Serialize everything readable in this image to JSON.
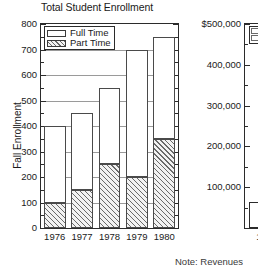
{
  "chart_data": [
    {
      "type": "bar",
      "id": "total-student-enrollment",
      "title": "Total Student Enrollment",
      "subtitle": "",
      "xlabel": "",
      "ylabel": "Fall Enrollment",
      "stacked": true,
      "grid": true,
      "legend_position": "top-left",
      "categories": [
        "1976",
        "1977",
        "1978",
        "1979",
        "1980"
      ],
      "ylim": [
        0,
        800
      ],
      "ytick_labels": [
        "0",
        "100",
        "200",
        "300",
        "400",
        "500",
        "600",
        "700",
        "800"
      ],
      "ytick_values": [
        0,
        100,
        200,
        300,
        400,
        500,
        600,
        700,
        800
      ],
      "minor_tick_interval": 50,
      "series": [
        {
          "name": "Part Time",
          "fill": "diagonal-hatch",
          "values": [
            100,
            150,
            250,
            200,
            350
          ]
        },
        {
          "name": "Full Time",
          "fill": "white",
          "values": [
            300,
            300,
            300,
            500,
            400
          ]
        }
      ],
      "totals": [
        400,
        450,
        550,
        700,
        750
      ],
      "colors": {
        "axis": "#2b2b2b",
        "gridline": "#9a9a9a",
        "bar_outline": "#4a4a4a",
        "hatch": "#6a6a6a",
        "background": "#ffffff"
      }
    },
    {
      "type": "bar",
      "id": "revenues-partial",
      "title": "",
      "ylabel": "",
      "clipped": true,
      "ytick_labels": [
        "$500,000",
        "400,000",
        "300,000",
        "200,000",
        "100,000"
      ],
      "ytick_values": [
        500000,
        400000,
        300000,
        200000,
        100000
      ],
      "ylim": [
        0,
        500000
      ],
      "xtick_labels": [
        "1"
      ]
    }
  ],
  "left_chart": {
    "title": "Total Student Enrollment",
    "ylabel": "Fall Enrollment",
    "legend": [
      {
        "label": "Full Time",
        "fill": "white"
      },
      {
        "label": "Part Time",
        "fill": "diagonal-hatch"
      }
    ],
    "ytick_labels": [
      "800",
      "700",
      "600",
      "500",
      "400",
      "300",
      "200",
      "100",
      "0"
    ],
    "xtick_labels": [
      "1976",
      "1977",
      "1978",
      "1979",
      "1980"
    ]
  },
  "right_chart": {
    "ytick_labels": [
      "$500,000",
      "400,000",
      "300,000",
      "200,000",
      "100,000"
    ],
    "xtick_labels": [
      "1"
    ]
  },
  "note": {
    "text": "Note: Revenues"
  }
}
